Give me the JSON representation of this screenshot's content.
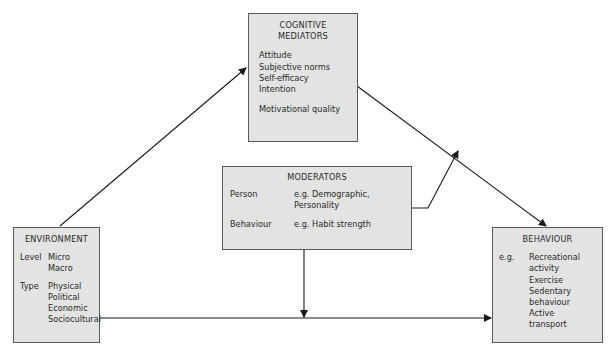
{
  "diagram": {
    "cognitive_mediators": {
      "title_line1": "COGNITIVE",
      "title_line2": "MEDIATORS",
      "items": [
        "Attitude",
        "Subjective norms",
        "Self-efficacy",
        "Intention"
      ],
      "extra": "Motivational quality"
    },
    "moderators": {
      "title": "MODERATORS",
      "rows": [
        {
          "label": "Person",
          "value_line1": "e.g. Demographic,",
          "value_line2": "Personality"
        },
        {
          "label": "Behaviour",
          "value_line1": "e.g. Habit strength"
        }
      ]
    },
    "environment": {
      "title": "ENVIRONMENT",
      "level_label": "Level",
      "level_values": [
        "Micro",
        "Macro"
      ],
      "type_label": "Type",
      "type_values": [
        "Physical",
        "Political",
        "Economic",
        "Sociocultural"
      ]
    },
    "behaviour": {
      "title": "BEHAVIOUR",
      "eg_label": "e.g.",
      "values": [
        "Recreational",
        "activity",
        "Exercise",
        "Sedentary",
        "behaviour",
        "Active",
        "transport"
      ]
    },
    "colors": {
      "box_fill": "#e3e3e3",
      "box_border": "#5a5a5a",
      "arrow": "#1a1a1a"
    }
  }
}
